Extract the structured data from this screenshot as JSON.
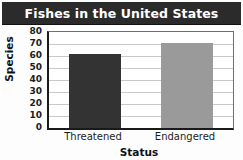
{
  "chart_data": {
    "type": "bar",
    "title": "Fishes in the United States",
    "xlabel": "Status",
    "ylabel": "Species",
    "categories": [
      "Threatened",
      "Endangered"
    ],
    "values": [
      62,
      71
    ],
    "series": [
      {
        "name": "Species",
        "values": [
          62,
          71
        ]
      }
    ],
    "ylim": [
      0,
      80
    ],
    "ytick_labels": [
      "80",
      "70",
      "60",
      "50",
      "40",
      "30",
      "20",
      "10",
      "0"
    ],
    "ytick_values": [
      80,
      70,
      60,
      50,
      40,
      30,
      20,
      10,
      0
    ],
    "grid": true,
    "legend": null,
    "bar_colors": [
      "#333333",
      "#9a9a9a"
    ],
    "title_background": "#2b2b2b",
    "title_color": "#ffffff",
    "gridline_color": "#c9c9c9",
    "axis_color": "#1a1a1a",
    "plot_background": "#ffffff"
  }
}
